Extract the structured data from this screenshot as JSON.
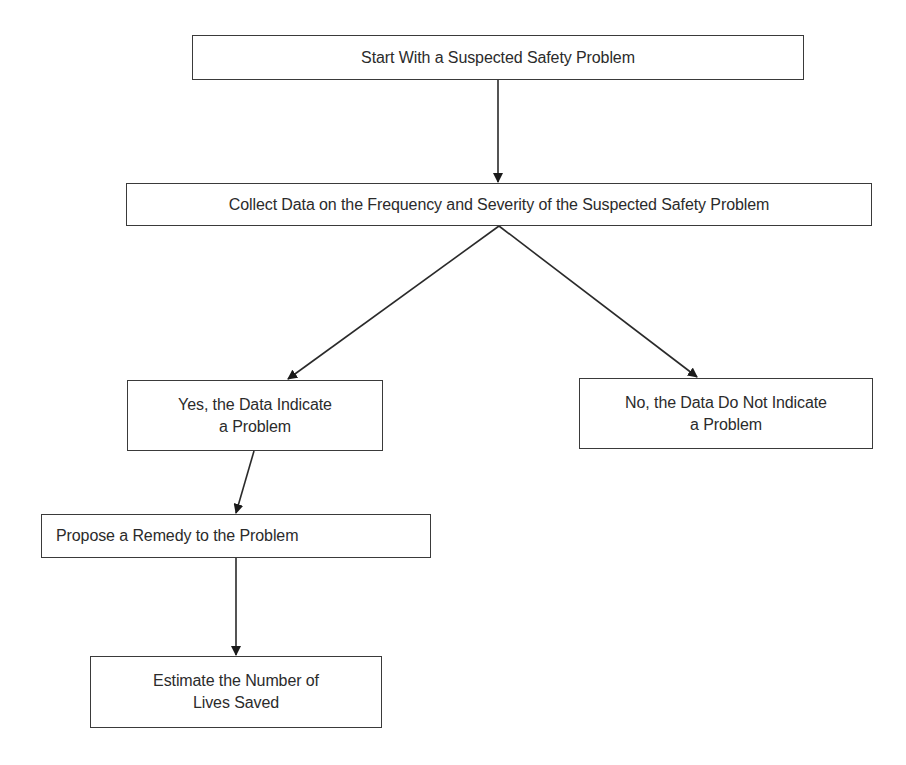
{
  "diagram": {
    "type": "flowchart",
    "nodes": {
      "start": {
        "lines": [
          "Start With a Suspected Safety Problem"
        ]
      },
      "collect": {
        "lines": [
          "Collect Data on the Frequency and Severity of the Suspected Safety Problem"
        ]
      },
      "yes": {
        "lines": [
          "Yes, the Data Indicate",
          "a Problem"
        ]
      },
      "no": {
        "lines": [
          "No, the Data Do Not Indicate",
          "a Problem"
        ]
      },
      "remedy": {
        "lines": [
          "Propose a Remedy to the Problem"
        ]
      },
      "estimate": {
        "lines": [
          "Estimate the Number of",
          "Lives Saved"
        ]
      }
    },
    "edges": [
      {
        "from": "start",
        "to": "collect"
      },
      {
        "from": "collect",
        "to": "yes"
      },
      {
        "from": "collect",
        "to": "no"
      },
      {
        "from": "yes",
        "to": "remedy"
      },
      {
        "from": "remedy",
        "to": "estimate"
      }
    ],
    "colors": {
      "stroke": "#3a3a3a",
      "text": "#2b2b2b",
      "background": "#ffffff"
    }
  }
}
